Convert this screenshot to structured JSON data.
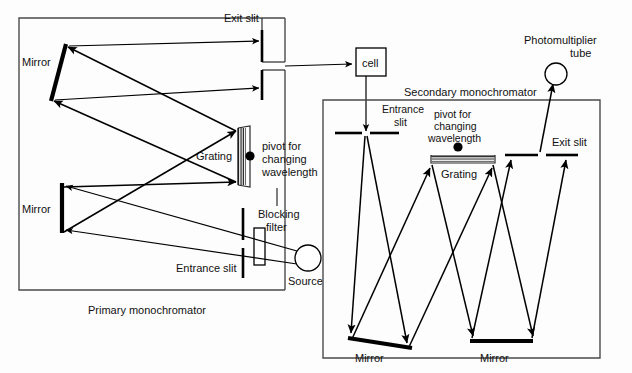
{
  "figure": {
    "background_color": "#fdfdfd",
    "line_color": "#000000",
    "box_color": "#4a4a4a"
  },
  "primary": {
    "caption": "Primary monochromator",
    "exit_slit_label": "Exit slit",
    "mirror_top_label": "Mirror",
    "mirror_bottom_label": "Mirror",
    "grating_label": "Grating",
    "pivot_label_line1": "pivot for",
    "pivot_label_line2": "changing",
    "pivot_label_line3": "wavelength",
    "blocking_filter_line1": "Blocking",
    "blocking_filter_line2": "filter",
    "entrance_slit_label": "Entrance slit",
    "source_label": "Source"
  },
  "cell": {
    "label": "cell"
  },
  "secondary": {
    "caption": "Secondary monochromator",
    "entrance_slit_line1": "Entrance",
    "entrance_slit_line2": "slit",
    "pivot_label_line1": "pivot for",
    "pivot_label_line2": "changing",
    "pivot_label_line3": "wavelength",
    "grating_label": "Grating",
    "exit_slit_label": "Exit slit",
    "mirror_left_label": "Mirror",
    "mirror_right_label": "Mirror"
  },
  "detector": {
    "label_line1": "Photomultiplier",
    "label_line2": "tube"
  }
}
